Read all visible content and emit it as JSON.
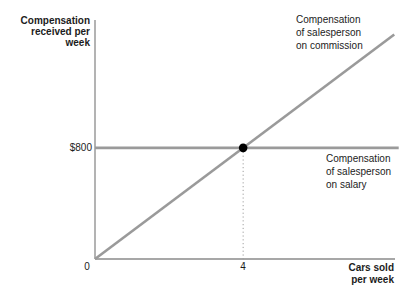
{
  "figure": {
    "background": "#ffffff"
  },
  "colors": {
    "axis": "#8a8a8a",
    "series_line": "#9a9a9a",
    "guide": "#9e9e9e",
    "dot": "#000000",
    "text": "#1c1c1c"
  },
  "chart_data": {
    "type": "line",
    "title": "",
    "xlabel": "Cars sold\nper week",
    "ylabel": "Compensation\nreceived per\nweek",
    "xlim": [
      0,
      8.1
    ],
    "ylim": [
      0,
      1720
    ],
    "grid": false,
    "legend": "inline-annotations",
    "x_ticks": [
      {
        "value": 0,
        "label": "0"
      },
      {
        "value": 4,
        "label": "4"
      }
    ],
    "y_ticks": [
      {
        "value": 800,
        "label": "$800"
      }
    ],
    "series": [
      {
        "name": "commission",
        "label": "Compensation\nof salesperson\non commission",
        "points": [
          [
            0,
            0
          ],
          [
            8.08,
            1616
          ]
        ],
        "slope_dollars_per_car": 200,
        "color": "#9a9a9a"
      },
      {
        "name": "salary",
        "label": "Compensation\nof salesperson\non salary",
        "points": [
          [
            0,
            800
          ],
          [
            8.2,
            800
          ]
        ],
        "color": "#9a9a9a"
      }
    ],
    "intersection_point": {
      "x": 4,
      "y": 800,
      "color": "#000000"
    },
    "guide_line": {
      "x": 4,
      "from_y": 0,
      "to_y": 800,
      "style": "dotted",
      "color": "#9e9e9e"
    }
  }
}
